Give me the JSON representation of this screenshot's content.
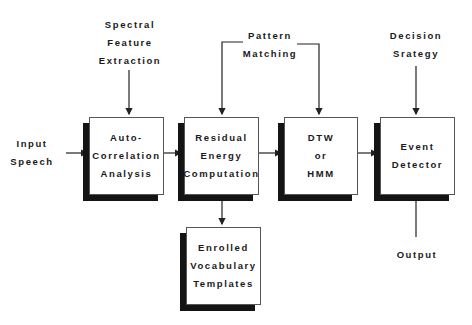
{
  "diagram": {
    "inputs": {
      "input_speech": [
        "Input",
        "Speech"
      ],
      "spectral_feature_extraction": [
        "Spectral",
        "Feature",
        "Extraction"
      ],
      "pattern_matching": [
        "Pattern",
        "Matching"
      ],
      "decision_strategy": [
        "Decision",
        "Srategy"
      ],
      "output": [
        "Output"
      ]
    },
    "boxes": {
      "autocorrelation": [
        "Auto-",
        "Correlation",
        "Analysis"
      ],
      "residual_energy": [
        "Residual",
        "Energy",
        "Computation"
      ],
      "dtw_hmm": [
        "DTW",
        "or",
        "HMM"
      ],
      "event_detector": [
        "Event",
        "Detector"
      ],
      "enrolled_vocabulary": [
        "Enrolled",
        "Vocabulary",
        "Templates"
      ]
    },
    "colors": {
      "shadow": "#141414",
      "line": "#222222",
      "border": "#555555"
    }
  }
}
